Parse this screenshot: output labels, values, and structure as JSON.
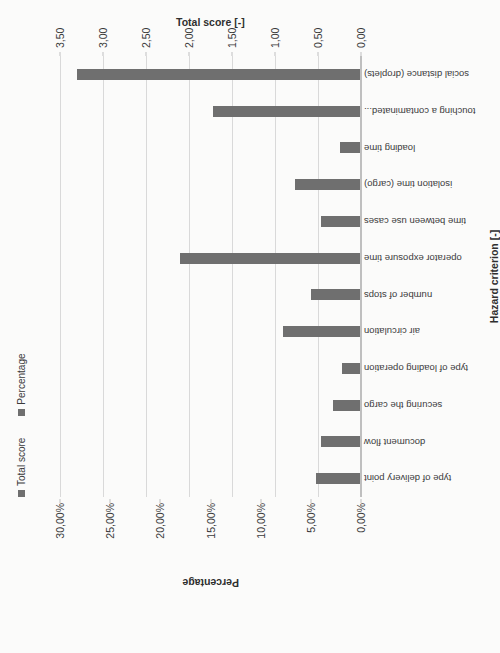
{
  "chart_data": {
    "type": "bar",
    "title": "",
    "subtitle": "",
    "categories": [
      "type of delivery point",
      "document flow",
      "securing the cargo",
      "type of loading operation",
      "air circulation",
      "number of stops",
      "operator exposure time",
      "time between use cases",
      "isolation time (cargo)",
      "loading time",
      "touching a contaminated...",
      "social distance (droplets)"
    ],
    "series": [
      {
        "name": "Total score",
        "values": [
          0.52,
          0.46,
          0.33,
          0.22,
          0.91,
          0.58,
          2.1,
          0.46,
          0.77,
          0.25,
          1.72,
          3.3
        ]
      }
    ],
    "xlabel": "Hazard criterion [-]",
    "ylabel": "Percentage",
    "y2label": "Total score [-]",
    "ylim": [
      0,
      0.3
    ],
    "y2lim": [
      0,
      3.5
    ],
    "ytick_labels": [
      "0,00%",
      "5,00%",
      "10,00%",
      "15,00%",
      "20,00%",
      "25,00%",
      "30,00%"
    ],
    "ytick_values": [
      0,
      0.05,
      0.1,
      0.15,
      0.2,
      0.25,
      0.3
    ],
    "y2tick_labels": [
      "0,00",
      "0,50",
      "1,00",
      "1,50",
      "2,00",
      "2,50",
      "3,00",
      "3,50"
    ],
    "y2tick_values": [
      0,
      0.5,
      1.0,
      1.5,
      2.0,
      2.5,
      3.0,
      3.5
    ],
    "grid": true,
    "legend_position": "top-left",
    "legend": [
      "Total score",
      "Percentage"
    ],
    "bar_color": "#6f6f6f",
    "grid_color": "#d9d9d9",
    "background": "#fbfbfa",
    "rotation": "-90deg"
  }
}
